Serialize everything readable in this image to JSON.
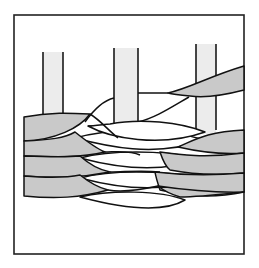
{
  "figure": {
    "title": "",
    "colors": {
      "background": "#ffffff",
      "frame": "#222222",
      "stake_fill": "#ececec",
      "rod_grey": "#c9c9c9",
      "rod_white": "#ffffff",
      "outline": "#111111"
    },
    "elements": {
      "stakes": [
        "left-stake",
        "middle-stake",
        "right-stake"
      ],
      "rod_layers": [
        "grey-rod-1",
        "grey-rod-2",
        "grey-rod-3",
        "grey-rod-4",
        "white-rod-1",
        "white-rod-2",
        "white-rod-3",
        "white-rod-4",
        "top-right-grey-rod"
      ]
    }
  }
}
